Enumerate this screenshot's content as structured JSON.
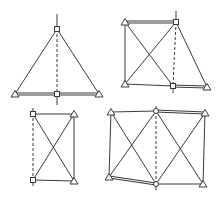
{
  "diagram": {
    "width": 219,
    "height": 203,
    "colors": {
      "stroke": "#3a3a3a",
      "background": "#ffffff"
    },
    "figures": [
      {
        "id": "fig-triangle",
        "nodes": [
          {
            "id": "apex",
            "x": 57,
            "y": 29,
            "shape": "square"
          },
          {
            "id": "base-left",
            "x": 15,
            "y": 94,
            "shape": "triangle"
          },
          {
            "id": "base-center",
            "x": 57,
            "y": 94,
            "shape": "square"
          },
          {
            "id": "base-right",
            "x": 99,
            "y": 94,
            "shape": "triangle"
          }
        ],
        "members": [
          {
            "from": [
              15,
              94
            ],
            "to": [
              57,
              29
            ],
            "style": "line"
          },
          {
            "from": [
              57,
              29
            ],
            "to": [
              99,
              94
            ],
            "style": "line"
          },
          {
            "from": [
              15,
              94
            ],
            "to": [
              99,
              94
            ],
            "style": "bar"
          },
          {
            "from": [
              57,
              29
            ],
            "to": [
              57,
              94
            ],
            "style": "dash"
          },
          {
            "from": [
              57,
              14
            ],
            "to": [
              57,
              29
            ],
            "style": "line"
          },
          {
            "from": [
              57,
              94
            ],
            "to": [
              57,
              105
            ],
            "style": "line"
          }
        ]
      },
      {
        "id": "fig-trapezoid-truss",
        "nodes": [
          {
            "id": "top-left",
            "x": 125,
            "y": 22,
            "shape": "triangle"
          },
          {
            "id": "top-right",
            "x": 176,
            "y": 22,
            "shape": "square"
          },
          {
            "id": "bottom-left",
            "x": 125,
            "y": 84,
            "shape": "triangle"
          },
          {
            "id": "bottom-mid",
            "x": 173,
            "y": 86,
            "shape": "square"
          },
          {
            "id": "bottom-right",
            "x": 207,
            "y": 87,
            "shape": "triangle"
          }
        ],
        "members": [
          {
            "from": [
              125,
              22
            ],
            "to": [
              176,
              22
            ],
            "style": "bar"
          },
          {
            "from": [
              125,
              22
            ],
            "to": [
              125,
              84
            ],
            "style": "line"
          },
          {
            "from": [
              125,
              84
            ],
            "to": [
              173,
              86
            ],
            "style": "line"
          },
          {
            "from": [
              173,
              86
            ],
            "to": [
              207,
              87
            ],
            "style": "bar"
          },
          {
            "from": [
              125,
              22
            ],
            "to": [
              173,
              86
            ],
            "style": "line"
          },
          {
            "from": [
              125,
              84
            ],
            "to": [
              176,
              22
            ],
            "style": "line"
          },
          {
            "from": [
              176,
              22
            ],
            "to": [
              207,
              87
            ],
            "style": "line"
          },
          {
            "from": [
              176,
              22
            ],
            "to": [
              173,
              86
            ],
            "style": "dash"
          },
          {
            "from": [
              176,
              11
            ],
            "to": [
              176,
              22
            ],
            "style": "line"
          },
          {
            "from": [
              173,
              86
            ],
            "to": [
              173,
              93
            ],
            "style": "line"
          }
        ]
      },
      {
        "id": "fig-rectangle-truss",
        "nodes": [
          {
            "id": "top-left",
            "x": 33,
            "y": 114,
            "shape": "square"
          },
          {
            "id": "top-right",
            "x": 74,
            "y": 114,
            "shape": "triangle"
          },
          {
            "id": "bottom-left",
            "x": 33,
            "y": 180,
            "shape": "square"
          },
          {
            "id": "bottom-right",
            "x": 74,
            "y": 181,
            "shape": "triangle"
          }
        ],
        "members": [
          {
            "from": [
              33,
              114
            ],
            "to": [
              74,
              114
            ],
            "style": "line"
          },
          {
            "from": [
              74,
              114
            ],
            "to": [
              74,
              181
            ],
            "style": "line"
          },
          {
            "from": [
              33,
              180
            ],
            "to": [
              74,
              181
            ],
            "style": "line"
          },
          {
            "from": [
              33,
              114
            ],
            "to": [
              74,
              181
            ],
            "style": "line"
          },
          {
            "from": [
              33,
              180
            ],
            "to": [
              74,
              114
            ],
            "style": "line"
          },
          {
            "from": [
              33,
              108
            ],
            "to": [
              33,
              188
            ],
            "style": "dash"
          }
        ]
      },
      {
        "id": "fig-double-panel-truss",
        "nodes": [
          {
            "id": "top-left",
            "x": 111,
            "y": 112,
            "shape": "triangle"
          },
          {
            "id": "top-mid",
            "x": 156,
            "y": 111,
            "shape": "circle"
          },
          {
            "id": "top-right",
            "x": 205,
            "y": 113,
            "shape": "triangle"
          },
          {
            "id": "bottom-left",
            "x": 109,
            "y": 177,
            "shape": "triangle"
          },
          {
            "id": "bottom-mid",
            "x": 156,
            "y": 184,
            "shape": "circle"
          },
          {
            "id": "bottom-right",
            "x": 203,
            "y": 184,
            "shape": "triangle"
          }
        ],
        "members": [
          {
            "from": [
              111,
              112
            ],
            "to": [
              156,
              111
            ],
            "style": "line"
          },
          {
            "from": [
              156,
              111
            ],
            "to": [
              205,
              113
            ],
            "style": "bar"
          },
          {
            "from": [
              111,
              112
            ],
            "to": [
              109,
              177
            ],
            "style": "line"
          },
          {
            "from": [
              205,
              113
            ],
            "to": [
              203,
              184
            ],
            "style": "line"
          },
          {
            "from": [
              109,
              177
            ],
            "to": [
              156,
              184
            ],
            "style": "bar"
          },
          {
            "from": [
              156,
              184
            ],
            "to": [
              203,
              184
            ],
            "style": "line"
          },
          {
            "from": [
              111,
              112
            ],
            "to": [
              156,
              184
            ],
            "style": "line"
          },
          {
            "from": [
              109,
              177
            ],
            "to": [
              156,
              111
            ],
            "style": "line"
          },
          {
            "from": [
              156,
              111
            ],
            "to": [
              203,
              184
            ],
            "style": "line"
          },
          {
            "from": [
              156,
              184
            ],
            "to": [
              205,
              113
            ],
            "style": "line"
          },
          {
            "from": [
              156,
              111
            ],
            "to": [
              156,
              184
            ],
            "style": "dash"
          },
          {
            "from": [
              156,
              106
            ],
            "to": [
              156,
              111
            ],
            "style": "line"
          },
          {
            "from": [
              156,
              184
            ],
            "to": [
              156,
              190
            ],
            "style": "line"
          }
        ]
      }
    ]
  }
}
